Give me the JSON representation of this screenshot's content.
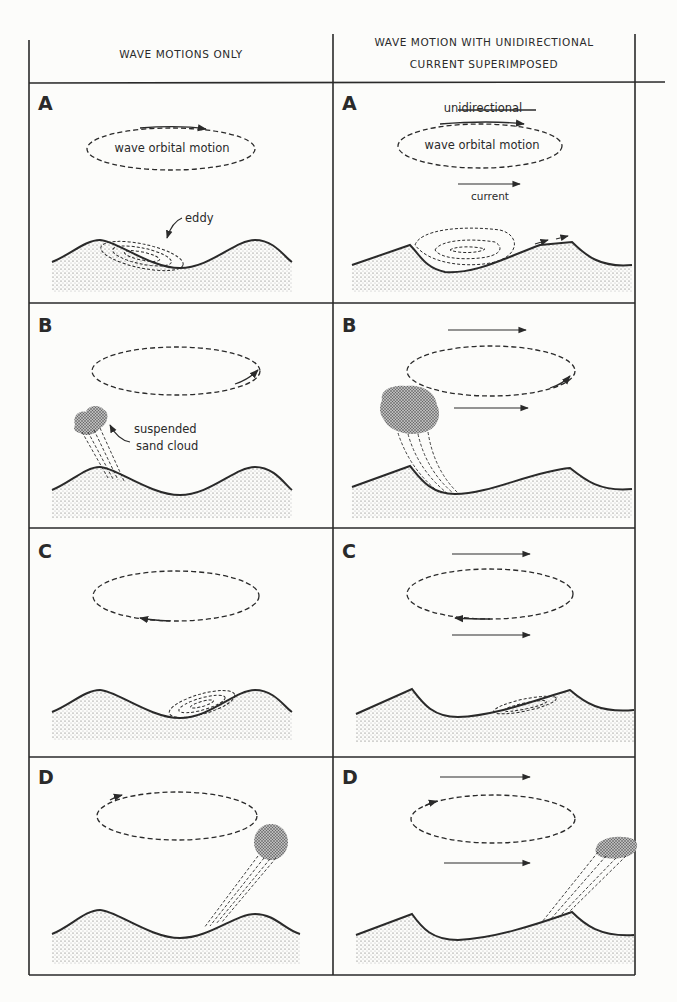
{
  "figure": {
    "columns": [
      {
        "id": "left",
        "header": "WAVE MOTIONS ONLY"
      },
      {
        "id": "right",
        "header_line1": "WAVE MOTION WITH UNIDIRECTIONAL",
        "header_line2": "CURRENT SUPERIMPOSED"
      }
    ],
    "rows": [
      {
        "letter": "A",
        "left": {
          "orbit_label": "wave orbital motion",
          "feature_label": "eddy"
        },
        "right": {
          "top_label": "unidirectional",
          "orbit_label": "wave orbital motion",
          "bottom_label": "current"
        }
      },
      {
        "letter": "B",
        "left": {
          "feature_label_line1": "suspended",
          "feature_label_line2": "sand cloud"
        },
        "right": {}
      },
      {
        "letter": "C",
        "left": {},
        "right": {}
      },
      {
        "letter": "D",
        "left": {},
        "right": {}
      }
    ]
  },
  "colors": {
    "ink": "#2a2a2a",
    "paper": "#fcfcfa",
    "sand": "#9a9a9a"
  }
}
